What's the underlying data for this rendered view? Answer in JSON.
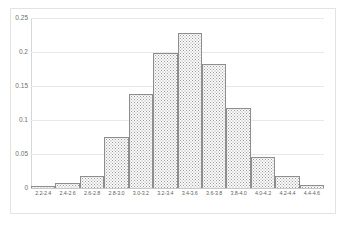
{
  "chart_data": {
    "type": "bar",
    "title": "",
    "subtitle": "",
    "xlabel": "",
    "ylabel": "",
    "categories": [
      "2.2-2.4",
      "2.4-2.6",
      "2.6-2.8",
      "2.8-3.0",
      "3.0-3.2",
      "3.2-3.4",
      "3.4-3.6",
      "3.6-3.8",
      "3.8-4.0",
      "4.0-4.2",
      "4.2-4.4",
      "4.4-4.6"
    ],
    "values": [
      0.003,
      0.007,
      0.018,
      0.075,
      0.138,
      0.198,
      0.228,
      0.183,
      0.117,
      0.045,
      0.017,
      0.004
    ],
    "yticks": [
      0.25,
      0.2,
      0.15,
      0.1,
      0.05,
      0
    ],
    "ytick_labels": [
      "0.25",
      "0.2",
      "0.15",
      "0.1",
      "0.05",
      "0"
    ],
    "ylim": [
      0,
      0.25
    ],
    "grid": true,
    "legend": false,
    "legend_position": "none",
    "annotations": [],
    "style": {
      "bar_fill": "#fbfbfb",
      "bar_pattern": "dotted",
      "bar_border": "#8e8e8e",
      "grid_color": "#e8e8e8",
      "axis_color": "#c9c9c9",
      "tick_text_color": "#6e6e6e",
      "background": "#ffffff",
      "frame_color": "#e3e3e3"
    }
  }
}
